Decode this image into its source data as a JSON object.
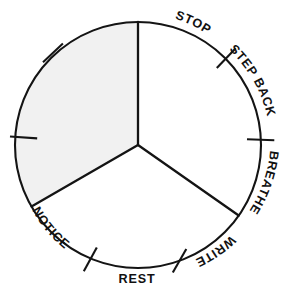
{
  "figure": {
    "kind": "circular-cycle-diagram",
    "title": "",
    "background_color": "#ffffff",
    "ink_color": "#141414"
  },
  "wheel": {
    "center_x": 138,
    "center_y": 145,
    "radius": 123,
    "stroke_color": "#141414",
    "sector_count": 3,
    "shaded_sector_color": "#f1f1f1",
    "plain_sector_color": "#ffffff"
  },
  "sectors": [
    {
      "name": "upper-left-sector",
      "shaded": true,
      "start_deg": 180,
      "end_deg": 270
    },
    {
      "name": "right-sector",
      "shaded": false,
      "start_deg": 270,
      "end_deg": 35
    },
    {
      "name": "bottom-sector",
      "shaded": false,
      "start_deg": 35,
      "end_deg": 180
    }
  ],
  "spokes": [
    {
      "name": "spoke-top",
      "angle_deg": 270
    },
    {
      "name": "spoke-lower-left",
      "angle_deg": 150
    },
    {
      "name": "spoke-lower-right",
      "angle_deg": 35
    }
  ],
  "labels": [
    {
      "id": "stop",
      "text": "STOP",
      "placement": "arc-top-right",
      "orientation": "curved"
    },
    {
      "id": "step_back",
      "text": "STEP BACK",
      "placement": "arc-right-upper",
      "orientation": "curved"
    },
    {
      "id": "breathe",
      "text": "BREATHE",
      "placement": "arc-right-lower",
      "orientation": "curved"
    },
    {
      "id": "write",
      "text": "WRITE",
      "placement": "arc-bottom-right",
      "orientation": "curved"
    },
    {
      "id": "rest",
      "text": "REST",
      "placement": "arc-bottom",
      "orientation": "horizontal"
    },
    {
      "id": "notice",
      "text": "NOTICE",
      "placement": "arc-bottom-left",
      "orientation": "curved"
    }
  ],
  "tick_marks": [
    {
      "name": "tick-upper-left",
      "angle_deg": 221
    },
    {
      "name": "tick-left",
      "angle_deg": 176
    },
    {
      "name": "tick-lower-left",
      "angle_deg": 111
    },
    {
      "name": "tick-lower-right",
      "angle_deg": 63
    },
    {
      "name": "tick-right",
      "angle_deg": 358
    },
    {
      "name": "tick-upper-right",
      "angle_deg": 310
    }
  ],
  "tick_count": 6,
  "label_count": 6
}
